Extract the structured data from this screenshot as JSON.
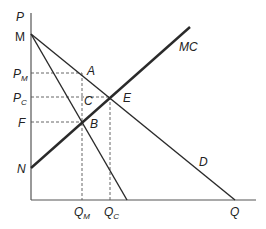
{
  "diagram": {
    "axes": {
      "y_label": "P",
      "x_label": "Q"
    },
    "curves": {
      "mc": {
        "label": "MC"
      },
      "demand": {
        "label": "D"
      },
      "mr": {
        "label": ""
      }
    },
    "points": {
      "m": "M",
      "n": "N",
      "a": "A",
      "b": "B",
      "c": "C",
      "e": "E"
    },
    "price_labels": {
      "pm_main": "P",
      "pm_sub": "M",
      "pc_main": "P",
      "pc_sub": "C",
      "f": "F"
    },
    "quantity_labels": {
      "qm_main": "Q",
      "qm_sub": "M",
      "qc_main": "Q",
      "qc_sub": "C",
      "q": "Q"
    },
    "colors": {
      "line": "#2a2a2a",
      "axis": "#555555",
      "dash": "#555555"
    }
  }
}
